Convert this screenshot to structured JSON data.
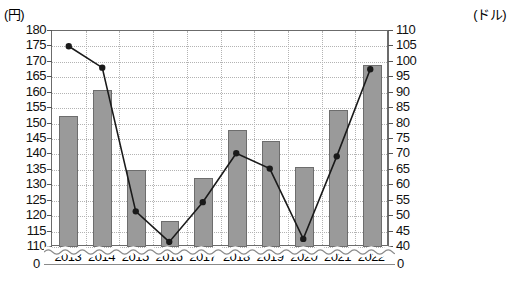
{
  "axes": {
    "left_unit_label": "(円)",
    "right_unit_label": "(ドル)",
    "left_ticks": [
      "180",
      "175",
      "170",
      "165",
      "160",
      "155",
      "150",
      "145",
      "140",
      "135",
      "130",
      "125",
      "120",
      "115",
      "110"
    ],
    "right_ticks": [
      "110",
      "105",
      "100",
      "95",
      "90",
      "85",
      "80",
      "75",
      "70",
      "65",
      "60",
      "55",
      "50",
      "45",
      "40"
    ],
    "left_zero": "0",
    "right_zero": "0",
    "break_note": "axis-break"
  },
  "chart_data": {
    "type": "bar",
    "title": "",
    "subtitle": "",
    "xlabel": "",
    "ylabel": "(円)",
    "y2label": "(ドル)",
    "grid": true,
    "legend": "none",
    "axis_break": true,
    "categories": [
      "2013",
      "2014",
      "2015",
      "2016",
      "2017",
      "2018",
      "2019",
      "2020",
      "2021",
      "2022"
    ],
    "ylim": [
      110,
      180
    ],
    "y2lim": [
      40,
      110
    ],
    "yticks": [
      110,
      115,
      120,
      125,
      130,
      135,
      140,
      145,
      150,
      155,
      160,
      165,
      170,
      175,
      180
    ],
    "y2ticks": [
      40,
      45,
      50,
      55,
      60,
      65,
      70,
      75,
      80,
      85,
      90,
      95,
      100,
      105,
      110
    ],
    "series": [
      {
        "name": "円",
        "type": "bar",
        "axis": "left",
        "unit": "(円)",
        "color": "#9a9a9a",
        "values": [
          152.5,
          161,
          135,
          118.5,
          132.5,
          148,
          144.5,
          136,
          154.5,
          169
        ]
      },
      {
        "name": "ドル",
        "type": "line",
        "axis": "right",
        "unit": "(ドル)",
        "color": "#1a1a1a",
        "marker": "circle",
        "values": [
          105,
          98,
          51,
          41,
          54,
          70,
          65,
          42,
          69,
          97.5
        ]
      }
    ]
  },
  "colors": {
    "bar_fill": "#9a9a9a",
    "bar_stroke": "#6d6d6d",
    "line": "#1a1a1a",
    "grid": "#b3b3b3",
    "frame": "#6b6b6b",
    "background": "#ffffff"
  }
}
